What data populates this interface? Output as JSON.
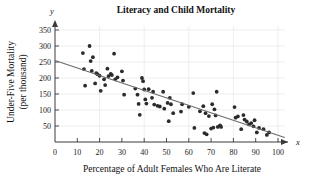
{
  "chart_data": {
    "type": "scatter",
    "title": "Literacy and Child Mortality",
    "xlabel": "Percentage of Adult Females Who Are Literate",
    "ylabel_line1": "Under-Five Mortality",
    "ylabel_line2": "(per thousand)",
    "x_axis_name": "x",
    "y_axis_name": "y",
    "xlim": [
      0,
      104
    ],
    "ylim": [
      0,
      375
    ],
    "xticks": [
      0,
      10,
      20,
      30,
      40,
      50,
      60,
      70,
      80,
      90,
      100
    ],
    "yticks": [
      50,
      100,
      150,
      200,
      250,
      300,
      350
    ],
    "xtick_labels": [
      "0",
      "10",
      "20",
      "30",
      "40",
      "50",
      "60",
      "70",
      "80",
      "90",
      "100"
    ],
    "ytick_labels": [
      "50",
      "100",
      "150",
      "200",
      "250",
      "300",
      "350"
    ],
    "grid": true,
    "grid_x_values": [
      20,
      40,
      60,
      80,
      100
    ],
    "grid_y_values": [
      50,
      100,
      150,
      200,
      250,
      300,
      350
    ],
    "legend": "none",
    "point_color": "#2b2b2b",
    "trend_line_color": "#6b6b6b",
    "grid_color": "#e6e6e6",
    "axis_color": "#3a3a3a",
    "trend_line": {
      "label": "least-squares regression line",
      "x_start": 0,
      "y_start": 255,
      "x_end": 103,
      "y_end": 14
    },
    "points": [
      [
        12.5,
        278
      ],
      [
        13.0,
        228
      ],
      [
        13.5,
        176
      ],
      [
        15.5,
        300
      ],
      [
        16.0,
        253
      ],
      [
        16.5,
        222
      ],
      [
        17.0,
        265
      ],
      [
        18.0,
        183
      ],
      [
        18.5,
        215
      ],
      [
        19.0,
        212
      ],
      [
        20.0,
        207
      ],
      [
        20.5,
        160
      ],
      [
        22.0,
        196
      ],
      [
        22.5,
        178
      ],
      [
        23.5,
        229
      ],
      [
        24.0,
        206
      ],
      [
        25.0,
        213
      ],
      [
        25.5,
        209
      ],
      [
        26.5,
        276
      ],
      [
        27.0,
        196
      ],
      [
        28.0,
        202
      ],
      [
        30.0,
        221
      ],
      [
        30.5,
        192
      ],
      [
        31.0,
        148
      ],
      [
        36.0,
        167
      ],
      [
        37.0,
        148
      ],
      [
        37.5,
        119
      ],
      [
        38.0,
        85
      ],
      [
        39.0,
        200
      ],
      [
        39.5,
        190
      ],
      [
        40.0,
        164
      ],
      [
        40.5,
        133
      ],
      [
        41.0,
        120
      ],
      [
        42.0,
        165
      ],
      [
        43.5,
        138
      ],
      [
        44.0,
        157
      ],
      [
        44.5,
        117
      ],
      [
        46.0,
        113
      ],
      [
        47.0,
        111
      ],
      [
        48.5,
        157
      ],
      [
        49.0,
        104
      ],
      [
        50.5,
        122
      ],
      [
        51.0,
        65
      ],
      [
        51.5,
        138
      ],
      [
        52.0,
        118
      ],
      [
        53.0,
        90
      ],
      [
        56.5,
        95
      ],
      [
        57.0,
        118
      ],
      [
        60.0,
        110
      ],
      [
        62.0,
        153
      ],
      [
        62.5,
        44
      ],
      [
        65.0,
        96
      ],
      [
        66.5,
        112
      ],
      [
        67.0,
        28
      ],
      [
        67.5,
        90
      ],
      [
        68.0,
        24
      ],
      [
        69.0,
        81
      ],
      [
        70.0,
        42
      ],
      [
        70.5,
        118
      ],
      [
        71.0,
        45
      ],
      [
        71.5,
        102
      ],
      [
        72.0,
        83
      ],
      [
        72.5,
        157
      ],
      [
        73.0,
        47
      ],
      [
        74.0,
        52
      ],
      [
        74.5,
        47
      ],
      [
        80.5,
        109
      ],
      [
        81.0,
        76
      ],
      [
        82.0,
        80
      ],
      [
        83.5,
        40
      ],
      [
        84.5,
        84
      ],
      [
        85.0,
        70
      ],
      [
        86.0,
        64
      ],
      [
        87.0,
        55
      ],
      [
        88.0,
        59
      ],
      [
        89.0,
        49
      ],
      [
        89.5,
        68
      ],
      [
        90.5,
        30
      ],
      [
        91.5,
        44
      ],
      [
        93.5,
        40
      ],
      [
        95.0,
        22
      ],
      [
        96.0,
        30
      ]
    ]
  }
}
